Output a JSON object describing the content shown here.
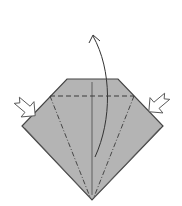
{
  "diagram": {
    "type": "origami-fold-step",
    "colors": {
      "paper_fill": "#b4b4b4",
      "edge": "#444444",
      "fold_line": "#3a3a3a",
      "arrow": "#333333",
      "push_arrow_fill": "#ffffff",
      "push_arrow_stroke": "#555555",
      "background": "#ffffff"
    },
    "elements": [
      {
        "name": "paper-shape",
        "kind": "polygon",
        "points": [
          [
            67,
            79
          ],
          [
            118,
            79
          ],
          [
            163,
            126
          ],
          [
            92,
            200
          ],
          [
            22,
            126
          ]
        ]
      },
      {
        "name": "valley-fold-line",
        "kind": "dashed-line",
        "from": [
          50,
          96
        ],
        "to": [
          134,
          96
        ]
      },
      {
        "name": "mountain-fold-left",
        "kind": "dash-dot-line",
        "from": [
          50,
          96
        ],
        "to": [
          90,
          197
        ]
      },
      {
        "name": "mountain-fold-right",
        "kind": "dash-dot-line",
        "from": [
          134,
          96
        ],
        "to": [
          94,
          197
        ]
      },
      {
        "name": "center-crease",
        "kind": "line",
        "from": [
          92,
          82
        ],
        "to": [
          92,
          195
        ]
      },
      {
        "name": "fold-up-arrow",
        "kind": "curved-arrow",
        "from": [
          95,
          157
        ],
        "to": [
          93,
          35
        ]
      },
      {
        "name": "push-arrow-left",
        "kind": "push-arrow",
        "direction": "right-down",
        "at": [
          30,
          105
        ]
      },
      {
        "name": "push-arrow-right",
        "kind": "push-arrow",
        "direction": "left-down",
        "at": [
          155,
          105
        ]
      }
    ]
  }
}
